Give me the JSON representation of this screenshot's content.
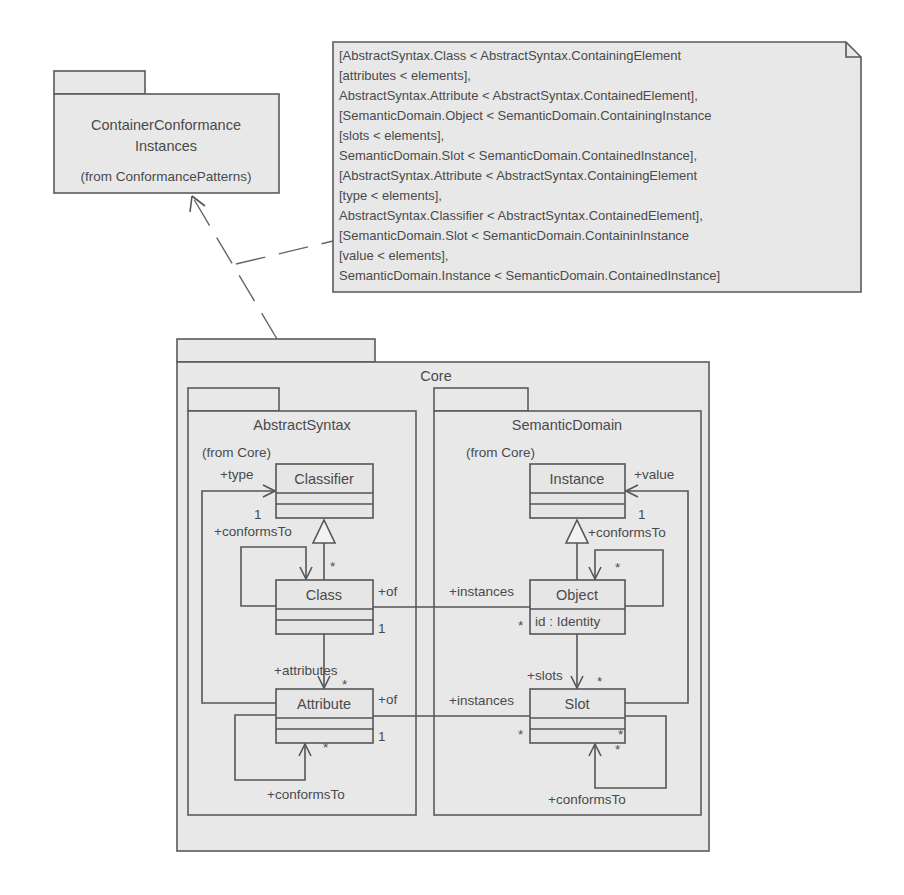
{
  "colors": {
    "background": "#ffffff",
    "fill": "#e6e6e6",
    "stroke": "#555555",
    "text": "#4a4a4a"
  },
  "external_package": {
    "name_line1": "ContainerConformance",
    "name_line2": "Instances",
    "from": "(from ConformancePatterns)"
  },
  "note": {
    "lines": [
      "[AbstractSyntax.Class < AbstractSyntax.ContainingElement",
      "[attributes < elements],",
      "AbstractSyntax.Attribute < AbstractSyntax.ContainedElement],",
      "[SemanticDomain.Object < SemanticDomain.ContainingInstance",
      "[slots < elements],",
      "SemanticDomain.Slot < SemanticDomain.ContainedInstance],",
      "[AbstractSyntax.Attribute < AbstractSyntax.ContainingElement",
      "[type < elements],",
      "AbstractSyntax.Classifier < AbstractSyntax.ContainedElement],",
      "[SemanticDomain.Slot < SemanticDomain.ContaininInstance",
      "[value < elements],",
      "SemanticDomain.Instance < SemanticDomain.ContainedInstance]"
    ]
  },
  "core": {
    "name": "Core",
    "abstract_syntax": {
      "name": "AbstractSyntax",
      "from": "(from Core)",
      "classes": {
        "classifier": "Classifier",
        "class": "Class",
        "attribute": "Attribute"
      },
      "labels": {
        "type_role": "+type",
        "type_mult": "1",
        "class_conforms": "+conformsTo",
        "class_conforms_mult": "*",
        "class_of": "+of",
        "class_of_mult": "1",
        "attributes_role": "+attributes",
        "attributes_mult": "*",
        "attribute_of": "+of",
        "attribute_of_mult": "1",
        "attribute_conforms_mult": "*",
        "attribute_conforms": "+conformsTo"
      }
    },
    "semantic_domain": {
      "name": "SemanticDomain",
      "from": "(from Core)",
      "classes": {
        "instance": "Instance",
        "object": "Object",
        "object_attr": "id : Identity",
        "slot": "Slot"
      },
      "labels": {
        "value_role": "+value",
        "value_mult": "1",
        "object_conforms": "+conformsTo",
        "object_conforms_mult": "*",
        "object_instances": "+instances",
        "object_instances_mult": "*",
        "slots_role": "+slots",
        "slots_mult": "*",
        "slot_instances": "+instances",
        "slot_instances_mult": "*",
        "slot_value_mult": "*",
        "slot_conforms_mult": "*",
        "slot_conforms": "+conformsTo"
      }
    }
  }
}
